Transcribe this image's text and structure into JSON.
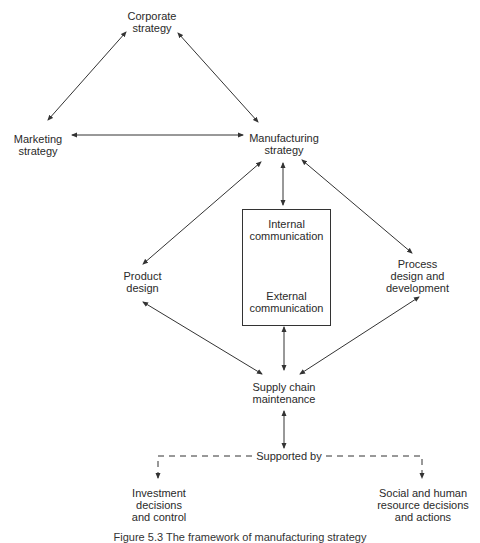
{
  "nodes": {
    "corporate_strategy": {
      "line1": "Corporate",
      "line2": "strategy"
    },
    "marketing_strategy": {
      "line1": "Marketing",
      "line2": "strategy"
    },
    "manufacturing_strategy": {
      "line1": "Manufacturing",
      "line2": "strategy"
    },
    "product_design": {
      "line1": "Product",
      "line2": "design"
    },
    "process_design": {
      "line1": "Process",
      "line2": "design and",
      "line3": "development"
    },
    "communication_box": {
      "internal_line1": "Internal",
      "internal_line2": "communication",
      "external_line1": "External",
      "external_line2": "communication"
    },
    "supply_chain": {
      "line1": "Supply chain",
      "line2": "maintenance"
    },
    "supported_by": "Supported by",
    "investment": {
      "line1": "Investment",
      "line2": "decisions",
      "line3": "and control"
    },
    "social_hr": {
      "line1": "Social and human",
      "line2": "resource decisions",
      "line3": "and actions"
    }
  },
  "caption": "Figure 5.3  The framework of manufacturing strategy",
  "colors": {
    "line": "#333333",
    "text": "#2a2a2a"
  }
}
